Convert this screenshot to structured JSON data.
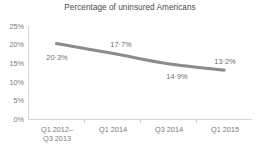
{
  "chart_data": {
    "type": "line",
    "title": "Percentage of uninsured Americans",
    "xlabel": "",
    "ylabel": "",
    "categories": [
      "Q1 2012–\nQ3 2013",
      "Q1 2014",
      "Q3 2014",
      "Q1 2015"
    ],
    "category_labels_flat": [
      "Q1 2012–Q3 2013",
      "Q1 2014",
      "Q3 2014",
      "Q1 2015"
    ],
    "values": [
      20.3,
      17.7,
      14.9,
      13.2
    ],
    "point_labels": [
      "20·3%",
      "17·7%",
      "14·9%",
      "13·2%"
    ],
    "ylim": [
      0,
      25
    ],
    "ytick_values": [
      0,
      5,
      10,
      15,
      20,
      25
    ],
    "ytick_labels": [
      "0%",
      "5%",
      "10%",
      "15%",
      "20%",
      "25%"
    ],
    "grid": false,
    "legend": "none",
    "smoothing": true,
    "markers": "none",
    "series": [
      {
        "name": "Percentage of uninsured Americans",
        "values": [
          20.3,
          17.7,
          14.9,
          13.2
        ]
      }
    ],
    "colors": {
      "line": "#8c8c8c",
      "axis": "#d4d4d4",
      "title_text": "#4a4a4a",
      "tick_text": "#7a7a7a",
      "label_text": "#6e6e6e",
      "background": "#ffffff"
    }
  }
}
